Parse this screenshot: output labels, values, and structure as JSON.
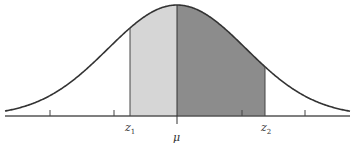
{
  "diagram": {
    "type": "normal-distribution-curve",
    "colors": {
      "curve": "#333333",
      "axis": "#555555",
      "shade_left": "#d6d6d6",
      "shade_right": "#8c8c8c"
    },
    "labels": {
      "z1": {
        "main": "z",
        "sub": "1"
      },
      "mu": "μ",
      "z2": {
        "main": "z",
        "sub": "2"
      }
    },
    "regions": [
      {
        "name": "z1-to-mu",
        "shade": "light"
      },
      {
        "name": "mu-to-z2",
        "shade": "dark"
      }
    ],
    "tick_count": 4
  }
}
